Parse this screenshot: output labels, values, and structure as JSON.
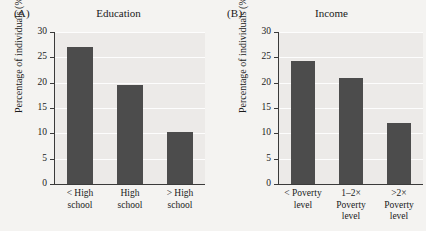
{
  "chart_data": [
    {
      "type": "bar",
      "panel": "(A)",
      "title": "Education",
      "categories": [
        "< High\nschool",
        "High\nschool",
        "> High\nschool"
      ],
      "values": [
        27.1,
        19.6,
        10.3
      ],
      "xlabel": "",
      "ylabel": "Percentage of individuals (%)",
      "ylim": [
        0,
        30
      ],
      "yticks": [
        0,
        5,
        10,
        15,
        20,
        25,
        30
      ],
      "grid": true,
      "legend": "none",
      "bar_color": "#4c4c4c",
      "plot_background": "#eceae8"
    },
    {
      "type": "bar",
      "panel": "(B)",
      "title": "Income",
      "categories": [
        "< Poverty\nlevel",
        "1–2×\nPoverty\nlevel",
        ">2×\nPoverty\nlevel"
      ],
      "values": [
        24.2,
        21.0,
        12.0
      ],
      "xlabel": "",
      "ylabel": "Percentage of individuals (%)",
      "ylim": [
        0,
        30
      ],
      "yticks": [
        0,
        5,
        10,
        15,
        20,
        25,
        30
      ],
      "grid": true,
      "legend": "none",
      "bar_color": "#4c4c4c",
      "plot_background": "#eceae8"
    }
  ],
  "panels": [
    {
      "letter": "(A)",
      "title": "Education",
      "ylabel": "Percentage of individuals (%)",
      "ticks": [
        "30",
        "25",
        "20",
        "15",
        "10",
        "5",
        "0"
      ],
      "categories": [
        "< High\nschool",
        "High\nschool",
        "> High\nschool"
      ],
      "values": [
        27.1,
        19.6,
        10.3
      ]
    },
    {
      "letter": "(B)",
      "title": "Income",
      "ylabel": "Percentage of individuals (%)",
      "ticks": [
        "30",
        "25",
        "20",
        "15",
        "10",
        "5",
        "0"
      ],
      "categories": [
        "< Poverty\nlevel",
        "1–2×\nPoverty\nlevel",
        ">2×\nPoverty\nlevel"
      ],
      "values": [
        24.2,
        21.0,
        12.0
      ]
    }
  ]
}
